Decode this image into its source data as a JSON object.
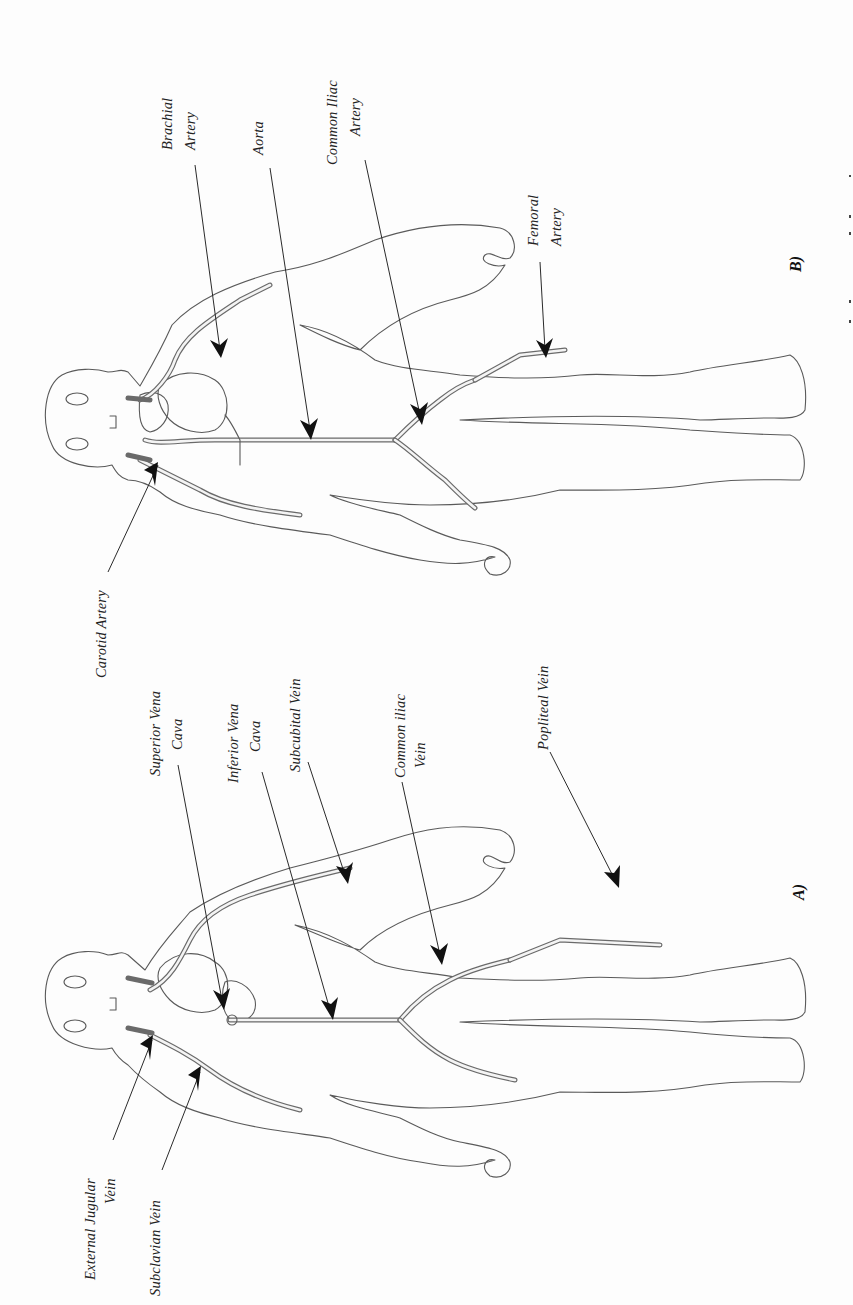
{
  "orientation": "page rotated 90 degrees clockwise",
  "figure_b": {
    "panel_label": "B)",
    "title": "Arteries",
    "labels": {
      "carotid": "Carotid Artery",
      "brachial_line1": "Brachial",
      "brachial_line2": "Artery",
      "aorta": "Aorta",
      "common_iliac_line1": "Common Iliac",
      "common_iliac_line2": "Artery",
      "femoral_line1": "Femoral",
      "femoral_line2": "Artery"
    }
  },
  "figure_a": {
    "panel_label": "A)",
    "title": "Veins",
    "labels": {
      "external_jugular_line1": "External Jugular",
      "external_jugular_line2": "Vein",
      "subclavian": "Subclavian Vein",
      "superior_vena_line1": "Superior Vena",
      "superior_vena_line2": "Cava",
      "inferior_vena_line1": "Inferior Vena",
      "inferior_vena_line2": "Cava",
      "subcubital": "Subcubital Vein",
      "common_iliac_line1": "Common iliac",
      "common_iliac_line2": "Vein",
      "popliteal": "Popliteal Vein"
    }
  },
  "colors": {
    "background": "#fdfdfd",
    "outline": "#5a5a5a",
    "arrow": "#111111",
    "text": "#222222"
  }
}
